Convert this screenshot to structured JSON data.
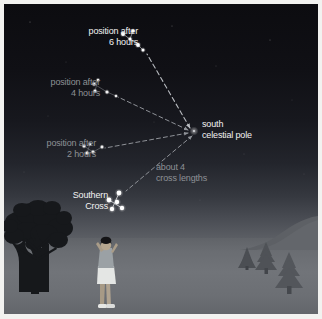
{
  "figure": {
    "border_color": "#f2f2f0",
    "width": 322,
    "height": 319
  },
  "scene": {
    "sky_top_color": "#0c0c10",
    "sky_horizon_color": "#5b5e64",
    "ground_color": "#6c6f74",
    "horizon_y": 234
  },
  "labels": {
    "position_6h": "position after\n6 hours",
    "position_4h": "position after\n4 hours",
    "position_2h": "position after\n2 hours",
    "south_celestial_pole": "south\ncelestial pole",
    "cross_lengths": "about 4\ncross lengths",
    "southern_cross": "Southern\nCross"
  },
  "colors": {
    "label_bright": "#f3f3f3",
    "label_dim": "#8e9196",
    "star": "#ffffff",
    "arrow": "#8f9298",
    "arrow_bright": "#b9bcc1",
    "tree_silhouette": "#17191c",
    "conifer": "#4f5257",
    "person_skin": "#b8a892",
    "person_hair": "#141416",
    "person_shirt": "#9aa0a4",
    "person_skirt": "#e2e4e3"
  },
  "sky_objects": {
    "south_celestial_pole": {
      "x": 190,
      "y": 127,
      "label": "south celestial pole"
    },
    "cross_positions": [
      {
        "name": "position-after-6-hours",
        "time_hours": 6,
        "label_brightness": "bright",
        "stars": [
          {
            "x": 119,
            "y": 30,
            "r": 1.9
          },
          {
            "x": 129,
            "y": 27,
            "r": 1.5
          },
          {
            "x": 126,
            "y": 35,
            "r": 1.6
          },
          {
            "x": 134,
            "y": 41,
            "r": 1.9
          },
          {
            "x": 139,
            "y": 46,
            "r": 1.5
          }
        ]
      },
      {
        "name": "position-after-4-hours",
        "time_hours": 4,
        "label_brightness": "dim",
        "stars": [
          {
            "x": 90,
            "y": 80,
            "r": 1.6
          },
          {
            "x": 94,
            "y": 76,
            "r": 1.3
          },
          {
            "x": 91,
            "y": 87,
            "r": 1.5
          },
          {
            "x": 103,
            "y": 88,
            "r": 1.5
          },
          {
            "x": 112,
            "y": 92,
            "r": 1.2
          }
        ]
      },
      {
        "name": "position-after-2-hours",
        "time_hours": 2,
        "label_brightness": "dim",
        "stars": [
          {
            "x": 80,
            "y": 142,
            "r": 1.5
          },
          {
            "x": 86,
            "y": 140,
            "r": 1.3
          },
          {
            "x": 83,
            "y": 149,
            "r": 1.6
          },
          {
            "x": 89,
            "y": 148,
            "r": 1.4
          },
          {
            "x": 98,
            "y": 143,
            "r": 1.4
          }
        ]
      },
      {
        "name": "southern-cross-now",
        "time_hours": 0,
        "label_brightness": "bright",
        "stars": [
          {
            "x": 105,
            "y": 196,
            "r": 2.4
          },
          {
            "x": 115,
            "y": 189,
            "r": 2.4
          },
          {
            "x": 113,
            "y": 198,
            "r": 2.2
          },
          {
            "x": 108,
            "y": 205,
            "r": 2.2
          },
          {
            "x": 118,
            "y": 204,
            "r": 2.2
          }
        ]
      }
    ],
    "arrows": [
      {
        "name": "arrow-to-6-hours",
        "from": [
          186,
          124
        ],
        "to": [
          141,
          48
        ],
        "style": "dashed",
        "bright": true
      },
      {
        "name": "arrow-to-4-hours",
        "from": [
          184,
          126
        ],
        "to": [
          112,
          93
        ],
        "style": "dashed",
        "bright": false
      },
      {
        "name": "arrow-to-2-hours",
        "from": [
          184,
          129
        ],
        "to": [
          99,
          144
        ],
        "style": "dashed",
        "bright": false
      },
      {
        "name": "arrow-to-southern-cross",
        "from": [
          188,
          132
        ],
        "to": [
          120,
          188
        ],
        "style": "dashed",
        "bright": false
      }
    ]
  },
  "foreground": {
    "tree": {
      "name": "broadleaf-tree-silhouette",
      "x": 4,
      "y": 198
    },
    "observer": {
      "name": "person-looking-up",
      "x": 92,
      "y": 244
    },
    "conifers": [
      {
        "name": "conifer-small-far",
        "x": 236,
        "y": 243,
        "w": 14,
        "h": 20
      },
      {
        "name": "conifer-medium",
        "x": 252,
        "y": 238,
        "w": 20,
        "h": 32
      },
      {
        "name": "conifer-large",
        "x": 272,
        "y": 248,
        "w": 26,
        "h": 44
      }
    ]
  }
}
